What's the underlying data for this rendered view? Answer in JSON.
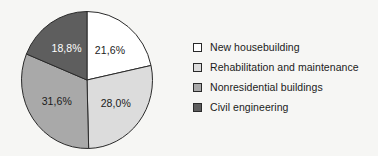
{
  "chart_data": {
    "type": "pie",
    "title": "",
    "subtitle": "",
    "xlabel": "",
    "ylabel": "",
    "grid": false,
    "legend_position": "right",
    "total": "100,0%",
    "decimal_separator": ",",
    "start_angle_deg": 0,
    "direction": "clockwise",
    "categories": [
      "New housebuilding",
      "Rehabilitation and maintenance",
      "Nonresidential buildings",
      "Civil engineering"
    ],
    "values": [
      21.6,
      28.0,
      31.6,
      18.8
    ],
    "value_labels": [
      "21,6%",
      "28,0%",
      "31,6%",
      "18,8%"
    ],
    "colors": [
      "#ffffff",
      "#dcdcdc",
      "#a9a9a9",
      "#5e5e5e"
    ],
    "slices": [
      {
        "label": "New housebuilding",
        "value": 21.6,
        "value_label": "21,6%",
        "color": "#ffffff",
        "label_text_color": "#1b1b1b"
      },
      {
        "label": "Rehabilitation and maintenance",
        "value": 28.0,
        "value_label": "28,0%",
        "color": "#dcdcdc",
        "label_text_color": "#1b1b1b"
      },
      {
        "label": "Nonresidential buildings",
        "value": 31.6,
        "value_label": "31,6%",
        "color": "#a9a9a9",
        "label_text_color": "#1b1b1b"
      },
      {
        "label": "Civil engineering",
        "value": 18.8,
        "value_label": "18,8%",
        "color": "#5e5e5e",
        "label_text_color": "#ffffff"
      }
    ]
  },
  "legend": {
    "items": [
      {
        "label": "New housebuilding",
        "color": "#ffffff"
      },
      {
        "label": "Rehabilitation and maintenance",
        "color": "#dcdcdc"
      },
      {
        "label": "Nonresidential buildings",
        "color": "#a9a9a9"
      },
      {
        "label": "Civil engineering",
        "color": "#5e5e5e"
      }
    ]
  },
  "style": {
    "background": "#f6f6f4",
    "outline": "#2a2a2a",
    "text": "#1b1b1b"
  }
}
